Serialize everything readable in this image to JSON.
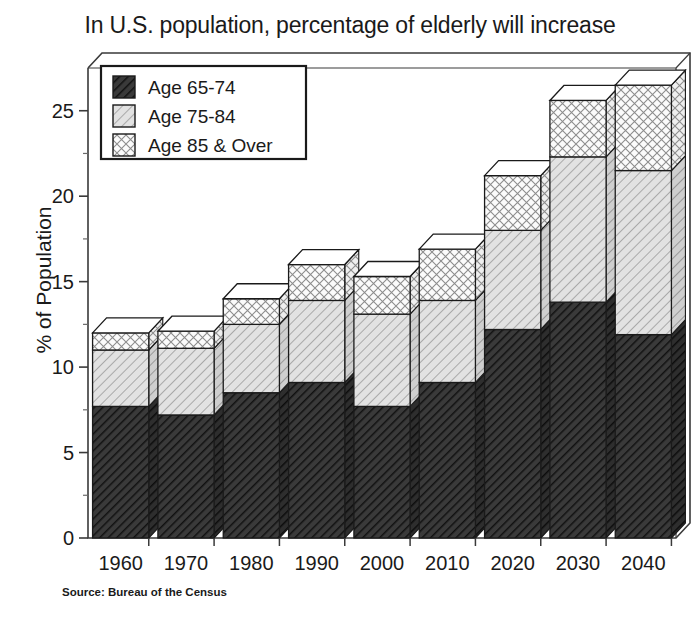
{
  "chart_data": {
    "type": "bar",
    "subtype": "stacked-bar-3d",
    "title": "In U.S. population, percentage of elderly will increase",
    "xlabel": "",
    "ylabel": "% of Population",
    "categories": [
      "1960",
      "1970",
      "1980",
      "1990",
      "2000",
      "2010",
      "2020",
      "2030",
      "2040"
    ],
    "series": [
      {
        "name": "Age 65-74",
        "values": [
          7.7,
          7.2,
          8.5,
          9.1,
          7.7,
          9.1,
          12.2,
          13.8,
          11.9
        ]
      },
      {
        "name": "Age 75-84",
        "values": [
          3.3,
          3.9,
          4.0,
          4.8,
          5.4,
          4.8,
          5.8,
          8.5,
          9.6
        ]
      },
      {
        "name": "Age 85 & Over",
        "values": [
          1.0,
          1.0,
          1.5,
          2.1,
          2.2,
          3.0,
          3.2,
          3.3,
          5.0
        ]
      }
    ],
    "totals": [
      12.0,
      12.1,
      14.0,
      16.0,
      15.3,
      16.9,
      21.2,
      25.6,
      26.5
    ],
    "yticks": [
      0,
      5,
      10,
      15,
      20,
      25
    ],
    "ylim": [
      0,
      27.5
    ],
    "grid": false,
    "legend_position": "top-left-inside",
    "source": "Source: Bureau of the Census",
    "colors": {
      "age_65_74": "#3d3d3d",
      "age_75_84": "#d9d9d9",
      "age_85_over": "#f7f7f7",
      "axis": "#555555",
      "outline": "#1a1a1a"
    }
  },
  "legend": {
    "items": [
      {
        "label": "Age 65-74",
        "swatch": "age_65_74"
      },
      {
        "label": "Age 75-84",
        "swatch": "age_75_84"
      },
      {
        "label": "Age 85 & Over",
        "swatch": "age_85_over"
      }
    ]
  }
}
